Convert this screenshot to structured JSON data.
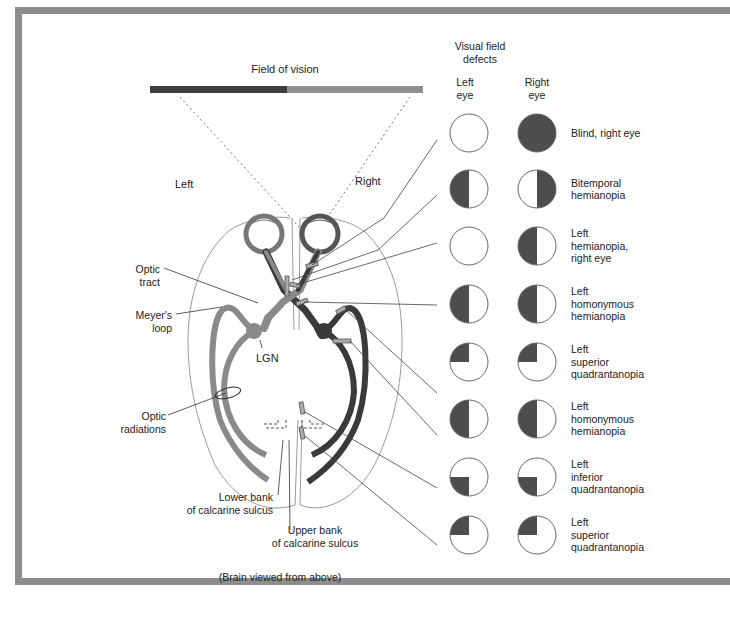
{
  "figure": {
    "title_field": "Field of vision",
    "side_left": "Left",
    "side_right": "Right",
    "caption": "(Brain viewed from above)",
    "colors": {
      "dark_pathway": "#3a3a3a",
      "light_pathway": "#8a8a8a",
      "field_dark": "#3d3d3d",
      "field_light": "#8f8f8f",
      "defect_fill": "#4d4d4d",
      "frame": "#8d8d8d"
    }
  },
  "anatomy_labels": {
    "optic_tract": [
      "Optic",
      "tract"
    ],
    "meyers_loop": [
      "Meyer's",
      "loop"
    ],
    "lgn": "LGN",
    "optic_radiations": [
      "Optic",
      "radiations"
    ],
    "lower_bank": [
      "Lower bank",
      "of calcarine sulcus"
    ],
    "upper_bank": [
      "Upper bank",
      "of calcarine sulcus"
    ]
  },
  "defects_panel": {
    "header": [
      "Visual field",
      "defects"
    ],
    "col_left": [
      "Left",
      "eye"
    ],
    "col_right": [
      "Right",
      "eye"
    ],
    "rows": [
      {
        "label": [
          "Blind, right eye"
        ],
        "left": "none",
        "right": "full"
      },
      {
        "label": [
          "Bitemporal",
          "hemianopia"
        ],
        "left": "left-half",
        "right": "right-half"
      },
      {
        "label": [
          "Left",
          "hemianopia,",
          "right eye"
        ],
        "left": "none",
        "right": "left-half"
      },
      {
        "label": [
          "Left",
          "homonymous",
          "hemianopia"
        ],
        "left": "left-half",
        "right": "left-half"
      },
      {
        "label": [
          "Left",
          "superior",
          "quadrantanopia"
        ],
        "left": "upper-left-quadrant",
        "right": "upper-left-quadrant"
      },
      {
        "label": [
          "Left",
          "homonymous",
          "hemianopia"
        ],
        "left": "left-half",
        "right": "left-half"
      },
      {
        "label": [
          "Left",
          "inferior",
          "quadrantanopia"
        ],
        "left": "lower-left-quadrant",
        "right": "lower-left-quadrant"
      },
      {
        "label": [
          "Left",
          "superior",
          "quadrantanopia"
        ],
        "left": "upper-left-quadrant",
        "right": "upper-left-quadrant"
      }
    ]
  }
}
